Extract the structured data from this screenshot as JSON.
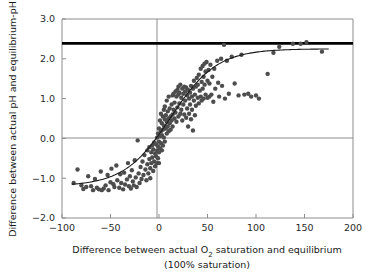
{
  "chart_data": {
    "type": "scatter",
    "title": "",
    "xlabel": "Difference between actual O2 saturation and equilibrium",
    "xlabel_line1_a": "Difference between actual O",
    "xlabel_line1_sub": "2",
    "xlabel_line1_b": " saturation and equilibrium",
    "xlabel_line2": "(100% saturation)",
    "ylabel": "Difference between actual pH and equilibrium-pH",
    "xlim": [
      -100,
      200
    ],
    "ylim": [
      -2.0,
      3.0
    ],
    "xticks": [
      -100,
      -50,
      0,
      50,
      100,
      150,
      200
    ],
    "xtick_labels": [
      "−100",
      "−50",
      "0",
      "50",
      "100",
      "150",
      "200"
    ],
    "yticks": [
      -2.0,
      -1.0,
      0.0,
      1.0,
      2.0,
      3.0
    ],
    "ytick_labels": [
      "−2.0",
      "−1.0",
      "0.0",
      "1.0",
      "2.0",
      "3.0"
    ],
    "grid": false,
    "legend": "none",
    "point_color": "#4d4d4d",
    "point_size": 3.4,
    "fit_curve_color": "#1a1a1a",
    "reference_line_color": "#000000",
    "axis_color": "#8c8c8c",
    "reference_lines": [
      {
        "name": "max-pH-difference-line",
        "orientation": "horizontal",
        "y": 2.4,
        "width": 2.6,
        "color": "#000000"
      },
      {
        "name": "zero-pH-line",
        "orientation": "horizontal",
        "y": 0.0,
        "width": 1.0,
        "color": "#8c8c8c"
      },
      {
        "name": "zero-saturation-line",
        "orientation": "vertical",
        "x": 0,
        "width": 1.0,
        "color": "#8c8c8c"
      }
    ],
    "fit_curve": {
      "name": "sigmoid-fit",
      "x_start": -90,
      "x_end": 175,
      "lower_asymptote": -1.2,
      "upper_asymptote": 2.25,
      "midpoint": 12,
      "steepness": 0.042
    },
    "points": [
      [
        -88,
        -1.12
      ],
      [
        -84,
        -0.78
      ],
      [
        -80,
        -1.18
      ],
      [
        -78,
        -1.27
      ],
      [
        -75,
        -1.22
      ],
      [
        -73,
        -0.95
      ],
      [
        -70,
        -1.2
      ],
      [
        -68,
        -1.3
      ],
      [
        -66,
        -1.02
      ],
      [
        -64,
        -1.24
      ],
      [
        -62,
        -1.28
      ],
      [
        -60,
        -0.83
      ],
      [
        -59,
        -1.3
      ],
      [
        -57,
        -1.26
      ],
      [
        -55,
        -1.18
      ],
      [
        -53,
        -0.92
      ],
      [
        -52,
        -1.3
      ],
      [
        -50,
        -1.1
      ],
      [
        -49,
        -0.76
      ],
      [
        -47,
        -1.15
      ],
      [
        -46,
        -1.22
      ],
      [
        -44,
        -0.68
      ],
      [
        -43,
        -1.05
      ],
      [
        -41,
        -1.24
      ],
      [
        -40,
        -0.9
      ],
      [
        -39,
        -1.12
      ],
      [
        -37,
        -1.28
      ],
      [
        -36,
        -0.86
      ],
      [
        -35,
        -1.16
      ],
      [
        -33,
        -1.03
      ],
      [
        -32,
        -0.62
      ],
      [
        -31,
        -1.2
      ],
      [
        -30,
        -0.95
      ],
      [
        -29,
        -1.26
      ],
      [
        -28,
        -0.8
      ],
      [
        -27,
        -1.08
      ],
      [
        -26,
        -1.18
      ],
      [
        -25,
        -0.55
      ],
      [
        -24,
        -0.98
      ],
      [
        -23,
        -1.22
      ],
      [
        -22,
        -0.05
      ],
      [
        -21,
        -0.88
      ],
      [
        -20,
        -1.12
      ],
      [
        -19,
        -0.72
      ],
      [
        -18,
        -1.02
      ],
      [
        -17,
        -0.58
      ],
      [
        -16,
        -0.92
      ],
      [
        -15,
        -0.42
      ],
      [
        -14,
        -0.78
      ],
      [
        -13,
        -1.05
      ],
      [
        -12,
        -0.3
      ],
      [
        -12,
        -0.65
      ],
      [
        -11,
        -0.88
      ],
      [
        -10,
        -0.22
      ],
      [
        -10,
        -0.52
      ],
      [
        -9,
        -0.75
      ],
      [
        -9,
        -1.0
      ],
      [
        -8,
        -0.35
      ],
      [
        -8,
        -0.62
      ],
      [
        -7,
        -0.18
      ],
      [
        -7,
        -0.48
      ],
      [
        -6,
        -0.82
      ],
      [
        -6,
        -0.28
      ],
      [
        -5,
        -0.58
      ],
      [
        -5,
        -0.1
      ],
      [
        -4,
        -0.38
      ],
      [
        -4,
        -0.7
      ],
      [
        -3,
        -0.15
      ],
      [
        -3,
        -0.45
      ],
      [
        -2,
        0.02
      ],
      [
        -2,
        -0.3
      ],
      [
        -2,
        -0.62
      ],
      [
        -1,
        -0.2
      ],
      [
        -1,
        0.12
      ],
      [
        -1,
        -0.5
      ],
      [
        0,
        -0.08
      ],
      [
        0,
        0.25
      ],
      [
        0,
        -0.35
      ],
      [
        0,
        -0.62
      ],
      [
        1,
        0.05
      ],
      [
        1,
        -0.25
      ],
      [
        1,
        0.45
      ],
      [
        2,
        -0.12
      ],
      [
        2,
        0.18
      ],
      [
        2,
        0.62
      ],
      [
        3,
        -0.3
      ],
      [
        3,
        0.08
      ],
      [
        3,
        0.38
      ],
      [
        4,
        0.55
      ],
      [
        4,
        -0.18
      ],
      [
        4,
        0.22
      ],
      [
        5,
        0.72
      ],
      [
        5,
        0.02
      ],
      [
        5,
        0.32
      ],
      [
        6,
        0.48
      ],
      [
        6,
        -0.08
      ],
      [
        6,
        0.8
      ],
      [
        7,
        0.25
      ],
      [
        7,
        0.58
      ],
      [
        8,
        0.12
      ],
      [
        8,
        0.42
      ],
      [
        8,
        0.95
      ],
      [
        9,
        0.3
      ],
      [
        9,
        0.68
      ],
      [
        10,
        0.5
      ],
      [
        10,
        0.18
      ],
      [
        10,
        1.05
      ],
      [
        11,
        0.38
      ],
      [
        11,
        0.75
      ],
      [
        12,
        0.55
      ],
      [
        12,
        0.22
      ],
      [
        13,
        0.85
      ],
      [
        13,
        0.45
      ],
      [
        14,
        1.08
      ],
      [
        14,
        0.6
      ],
      [
        14,
        0.3
      ],
      [
        15,
        0.72
      ],
      [
        15,
        1.12
      ],
      [
        16,
        0.5
      ],
      [
        16,
        0.9
      ],
      [
        17,
        1.18
      ],
      [
        17,
        0.65
      ],
      [
        18,
        1.05
      ],
      [
        18,
        0.42
      ],
      [
        19,
        1.22
      ],
      [
        19,
        0.78
      ],
      [
        20,
        1.1
      ],
      [
        20,
        0.55
      ],
      [
        20,
        1.3
      ],
      [
        21,
        0.88
      ],
      [
        21,
        1.15
      ],
      [
        22,
        0.62
      ],
      [
        22,
        1.35
      ],
      [
        23,
        1.02
      ],
      [
        23,
        0.72
      ],
      [
        24,
        1.25
      ],
      [
        24,
        0.45
      ],
      [
        25,
        1.12
      ],
      [
        25,
        0.85
      ],
      [
        26,
        1.3
      ],
      [
        26,
        0.6
      ],
      [
        27,
        1.18
      ],
      [
        27,
        0.95
      ],
      [
        28,
        1.28
      ],
      [
        28,
        0.52
      ],
      [
        29,
        1.08
      ],
      [
        29,
        0.75
      ],
      [
        30,
        1.22
      ],
      [
        30,
        0.3
      ],
      [
        31,
        1.0
      ],
      [
        31,
        0.62
      ],
      [
        32,
        1.15
      ],
      [
        32,
        0.85
      ],
      [
        33,
        1.32
      ],
      [
        33,
        0.48
      ],
      [
        34,
        1.05
      ],
      [
        34,
        0.72
      ],
      [
        35,
        1.25
      ],
      [
        35,
        0.2
      ],
      [
        36,
        0.95
      ],
      [
        36,
        1.45
      ],
      [
        37,
        1.1
      ],
      [
        37,
        0.58
      ],
      [
        38,
        1.3
      ],
      [
        38,
        0.82
      ],
      [
        39,
        1.52
      ],
      [
        40,
        1.02
      ],
      [
        40,
        1.35
      ],
      [
        41,
        1.6
      ],
      [
        41,
        0.88
      ],
      [
        42,
        1.2
      ],
      [
        43,
        1.75
      ],
      [
        43,
        1.05
      ],
      [
        44,
        1.42
      ],
      [
        44,
        0.95
      ],
      [
        45,
        1.82
      ],
      [
        45,
        1.25
      ],
      [
        46,
        1.55
      ],
      [
        46,
        1.0
      ],
      [
        47,
        1.88
      ],
      [
        47,
        1.35
      ],
      [
        48,
        1.1
      ],
      [
        48,
        1.68
      ],
      [
        49,
        1.92
      ],
      [
        50,
        1.45
      ],
      [
        50,
        1.02
      ],
      [
        51,
        1.72
      ],
      [
        52,
        1.05
      ],
      [
        52,
        1.38
      ],
      [
        53,
        1.85
      ],
      [
        54,
        1.1
      ],
      [
        55,
        1.55
      ],
      [
        56,
        0.92
      ],
      [
        57,
        1.75
      ],
      [
        58,
        1.25
      ],
      [
        60,
        1.95
      ],
      [
        61,
        1.4
      ],
      [
        62,
        1.05
      ],
      [
        64,
        2.0
      ],
      [
        65,
        1.32
      ],
      [
        67,
        2.35
      ],
      [
        68,
        1.0
      ],
      [
        70,
        1.95
      ],
      [
        72,
        1.12
      ],
      [
        75,
        2.05
      ],
      [
        78,
        1.38
      ],
      [
        82,
        1.08
      ],
      [
        85,
        2.1
      ],
      [
        88,
        1.1
      ],
      [
        92,
        1.12
      ],
      [
        95,
        1.05
      ],
      [
        100,
        1.08
      ],
      [
        103,
        1.0
      ],
      [
        112,
        1.62
      ],
      [
        118,
        2.15
      ],
      [
        124,
        2.3
      ],
      [
        138,
        2.38
      ],
      [
        146,
        2.38
      ],
      [
        152,
        2.42
      ],
      [
        168,
        2.18
      ]
    ]
  },
  "layout": {
    "plot_left_x": -100,
    "plot_right_x": 200,
    "plot_top_y": 3.0,
    "plot_bottom_y": -2.0
  }
}
